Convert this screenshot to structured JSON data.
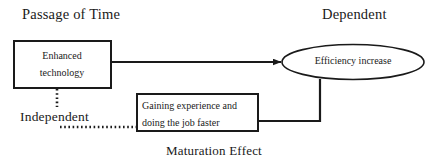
{
  "diagram": {
    "title_left": "Passage of Time",
    "title_right": "Dependent",
    "label_independent": "Independent",
    "label_maturation": "Maturation Effect",
    "boxes": [
      {
        "id": "enhanced-technology",
        "line1": "Enhanced",
        "line2": "technology",
        "shape": "rectangle",
        "x": 13,
        "y": 40,
        "w": 98,
        "h": 48,
        "stroke": "#1a1a1a",
        "stroke_width": 2
      },
      {
        "id": "gaining-experience",
        "line1": "Gaining experience and",
        "line2": "doing the job faster",
        "shape": "rectangle",
        "x": 136,
        "y": 93,
        "w": 122,
        "h": 38,
        "stroke": "#1a1a1a",
        "stroke_width": 2
      }
    ],
    "ellipses": [
      {
        "id": "efficiency-increase",
        "label": "Efficiency increase",
        "shape": "ellipse",
        "cx": 353,
        "cy": 62,
        "rx": 71,
        "ry": 17,
        "stroke": "#1a1a1a",
        "stroke_width": 1.6
      }
    ],
    "connectors": [
      {
        "id": "tech-to-efficiency",
        "from": "enhanced-technology",
        "to": "efficiency-increase",
        "style": "solid",
        "arrow": "single",
        "path": "M 111 62 L 280 62"
      },
      {
        "id": "experience-to-efficiency",
        "from": "gaining-experience",
        "to": "efficiency-increase",
        "style": "solid",
        "arrow": "none",
        "path": "M 258 121 L 320 121 L 320 78"
      },
      {
        "id": "tech-to-independent",
        "from": "enhanced-technology",
        "to": "label-independent",
        "style": "dotted",
        "arrow": "none",
        "path": "M 57 89 L 57 107"
      },
      {
        "id": "independent-to-experience",
        "from": "label-independent",
        "to": "gaining-experience",
        "style": "dotted",
        "arrow": "none",
        "path": "M 60 127 L 135 127"
      }
    ],
    "colors": {
      "stroke": "#1a1a1a",
      "text": "#1a1a1a",
      "background": "#ffffff"
    }
  }
}
